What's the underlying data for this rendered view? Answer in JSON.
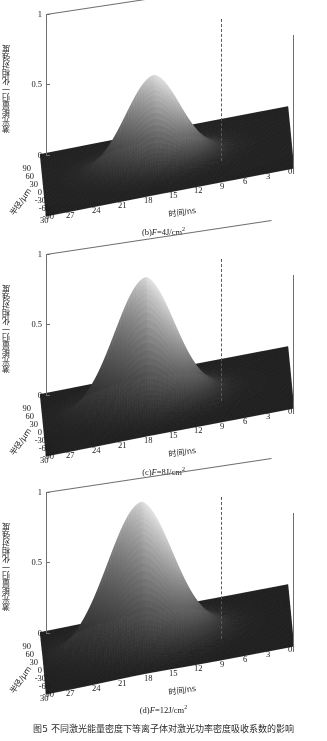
{
  "figure": {
    "caption": "图5  不同激光能量密度下等离子体对激光功率密度吸收系数的影响",
    "panel_count": 3
  },
  "axes": {
    "z_label": "激光能量归一化相对强度",
    "z_ticks": [
      "0",
      "0.5",
      "1"
    ],
    "x_label": "时间/ns",
    "x_ticks": [
      "30",
      "27",
      "24",
      "21",
      "18",
      "15",
      "12",
      "9",
      "6",
      "3",
      "0"
    ],
    "y_label": "半径/μm",
    "y_ticks": [
      "90",
      "60",
      "30",
      "0",
      "-30",
      "-60",
      "-90"
    ]
  },
  "panels": [
    {
      "id": "b",
      "caption_prefix": "(b)",
      "caption_var": "F",
      "caption_value": "=4J/cm",
      "caption_exp": "2",
      "caption_full": "(b)F=4J/cm2",
      "peak_value": 0.62,
      "peak_time_ns": 16.5,
      "peak_radius_um": 0
    },
    {
      "id": "c",
      "caption_prefix": "(c)",
      "caption_var": "F",
      "caption_value": "=8J/cm",
      "caption_exp": "2",
      "caption_full": "(c)F=8J/cm2",
      "peak_value": 0.9,
      "peak_time_ns": 17.5,
      "peak_radius_um": 0
    },
    {
      "id": "d",
      "caption_prefix": "(d)",
      "caption_var": "F",
      "caption_value": "=12J/cm",
      "caption_exp": "2",
      "caption_full": "(d)F=12J/cm2",
      "peak_value": 1.0,
      "peak_time_ns": 18,
      "peak_radius_um": 0
    }
  ],
  "colors": {
    "axis_line": "#6f6f6f",
    "dashed_line": "#5a5a5a",
    "surface_dark": "#1b1b1b",
    "surface_mid": "#6b6b6b",
    "surface_light": "#c9c9c9",
    "background": "#ffffff",
    "text": "#1a1a1a"
  },
  "chart_data": {
    "type": "surface",
    "title": "不同激光能量密度下等离子体对激光功率密度吸收系数的影响",
    "xlabel": "时间/ns",
    "ylabel": "半径/μm",
    "zlabel": "激光能量归一化相对强度",
    "xlim": [
      0,
      30
    ],
    "ylim": [
      -90,
      90
    ],
    "zlim": [
      0,
      1
    ],
    "xticks": [
      0,
      3,
      6,
      9,
      12,
      15,
      18,
      21,
      24,
      27,
      30
    ],
    "yticks": [
      -90,
      -60,
      -30,
      0,
      30,
      60,
      90
    ],
    "zticks": [
      0,
      0.5,
      1
    ],
    "grid": false,
    "legend": "none",
    "colormap": "gray",
    "annotations": [
      {
        "type": "vertical-dashed-line",
        "at_time_ns": 15,
        "note": "dashed reference line at back-right box edge"
      }
    ],
    "series": [
      {
        "name": "(b) F=4J/cm2",
        "peak_z": 0.62,
        "peak_x_ns": 16.5,
        "peak_y_um": 0,
        "z_profile_time": [
          {
            "t": 0,
            "z": 0.01
          },
          {
            "t": 3,
            "z": 0.02
          },
          {
            "t": 6,
            "z": 0.04
          },
          {
            "t": 9,
            "z": 0.08
          },
          {
            "t": 12,
            "z": 0.2
          },
          {
            "t": 15,
            "z": 0.52
          },
          {
            "t": 16.5,
            "z": 0.62
          },
          {
            "t": 18,
            "z": 0.5
          },
          {
            "t": 21,
            "z": 0.28
          },
          {
            "t": 24,
            "z": 0.12
          },
          {
            "t": 27,
            "z": 0.05
          },
          {
            "t": 30,
            "z": 0.02
          }
        ],
        "z_profile_radius": [
          {
            "r": -90,
            "z": 0.01
          },
          {
            "r": -60,
            "z": 0.05
          },
          {
            "r": -30,
            "z": 0.28
          },
          {
            "r": 0,
            "z": 0.62
          },
          {
            "r": 30,
            "z": 0.28
          },
          {
            "r": 60,
            "z": 0.05
          },
          {
            "r": 90,
            "z": 0.01
          }
        ]
      },
      {
        "name": "(c) F=8J/cm2",
        "peak_z": 0.9,
        "peak_x_ns": 17.5,
        "peak_y_um": 0,
        "z_profile_time": [
          {
            "t": 0,
            "z": 0.01
          },
          {
            "t": 3,
            "z": 0.02
          },
          {
            "t": 6,
            "z": 0.05
          },
          {
            "t": 9,
            "z": 0.1
          },
          {
            "t": 12,
            "z": 0.26
          },
          {
            "t": 15,
            "z": 0.72
          },
          {
            "t": 17.5,
            "z": 0.9
          },
          {
            "t": 18,
            "z": 0.85
          },
          {
            "t": 21,
            "z": 0.55
          },
          {
            "t": 24,
            "z": 0.3
          },
          {
            "t": 27,
            "z": 0.12
          },
          {
            "t": 30,
            "z": 0.04
          }
        ],
        "z_profile_radius": [
          {
            "r": -90,
            "z": 0.01
          },
          {
            "r": -60,
            "z": 0.08
          },
          {
            "r": -30,
            "z": 0.42
          },
          {
            "r": 0,
            "z": 0.9
          },
          {
            "r": 30,
            "z": 0.42
          },
          {
            "r": 60,
            "z": 0.08
          },
          {
            "r": 90,
            "z": 0.01
          }
        ]
      },
      {
        "name": "(d) F=12J/cm2",
        "peak_z": 1.0,
        "peak_x_ns": 18,
        "peak_y_um": 0,
        "z_profile_time": [
          {
            "t": 0,
            "z": 0.01
          },
          {
            "t": 3,
            "z": 0.03
          },
          {
            "t": 6,
            "z": 0.06
          },
          {
            "t": 9,
            "z": 0.12
          },
          {
            "t": 12,
            "z": 0.3
          },
          {
            "t": 15,
            "z": 0.8
          },
          {
            "t": 18,
            "z": 1.0
          },
          {
            "t": 21,
            "z": 0.68
          },
          {
            "t": 24,
            "z": 0.38
          },
          {
            "t": 27,
            "z": 0.16
          },
          {
            "t": 30,
            "z": 0.05
          }
        ],
        "z_profile_radius": [
          {
            "r": -90,
            "z": 0.01
          },
          {
            "r": -60,
            "z": 0.1
          },
          {
            "r": -30,
            "z": 0.5
          },
          {
            "r": 0,
            "z": 1.0
          },
          {
            "r": 30,
            "z": 0.5
          },
          {
            "r": 60,
            "z": 0.1
          },
          {
            "r": 90,
            "z": 0.01
          }
        ]
      }
    ]
  }
}
